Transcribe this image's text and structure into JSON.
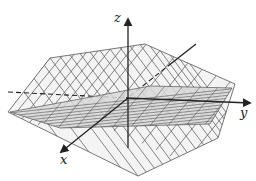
{
  "figure": {
    "type": "3d-planes-diagram",
    "colors": {
      "background": "#ffffff",
      "plane_fill": "#f4f4f4",
      "grid_line": "#555555",
      "flat_plane_fill": "#d8d8d8",
      "axis": "#222222"
    },
    "axes": {
      "x": {
        "label": "x"
      },
      "y": {
        "label": "y"
      },
      "z": {
        "label": "z"
      }
    },
    "planes": [
      {
        "name": "tilted-plane",
        "grid": "light"
      },
      {
        "name": "flat-plane",
        "grid": "dense"
      }
    ]
  }
}
